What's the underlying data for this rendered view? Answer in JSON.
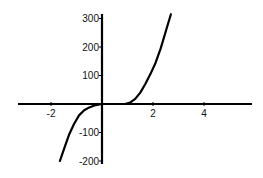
{
  "chart_data": {
    "type": "line",
    "title": "",
    "xlabel": "",
    "ylabel": "",
    "xlim": [
      -3.3,
      5.9
    ],
    "ylim": [
      -200,
      315
    ],
    "grid": false,
    "legend": null,
    "x_ticks": [
      {
        "value": -2,
        "label": "-2"
      },
      {
        "value": 2,
        "label": "2"
      },
      {
        "value": 4,
        "label": "4"
      }
    ],
    "y_ticks": [
      {
        "value": 300,
        "label": "300"
      },
      {
        "value": 200,
        "label": "200"
      },
      {
        "value": 100,
        "label": "100"
      },
      {
        "value": -100,
        "label": "-100"
      },
      {
        "value": -200,
        "label": "-200"
      }
    ],
    "series": [
      {
        "name": "f(x)",
        "color": "#000000",
        "x": [
          -1.65,
          -1.5,
          -1.3,
          -1.1,
          -0.9,
          -0.7,
          -0.5,
          -0.3,
          -0.1,
          0,
          0.3,
          0.6,
          0.9,
          1.1,
          1.3,
          1.5,
          1.7,
          1.9,
          2.1,
          2.3,
          2.5,
          2.7
        ],
        "y": [
          -200,
          -160,
          -110,
          -70,
          -40,
          -22,
          -12,
          -5,
          -1,
          0,
          0,
          0,
          0,
          5,
          18,
          40,
          70,
          105,
          145,
          195,
          255,
          315
        ]
      }
    ]
  }
}
